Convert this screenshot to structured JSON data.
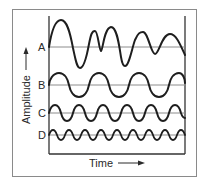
{
  "figure": {
    "y_axis_label": "Amplitude",
    "x_axis_label": "Time",
    "waves": [
      {
        "label": "A",
        "description": "irregular complex wave",
        "baseline_y": 47
      },
      {
        "label": "B",
        "description": "regular sine wave, low frequency",
        "baseline_y": 85
      },
      {
        "label": "C",
        "description": "regular sine wave, medium frequency",
        "baseline_y": 113
      },
      {
        "label": "D",
        "description": "regular sine wave, high frequency",
        "baseline_y": 135
      }
    ]
  },
  "colors": {
    "frame": "#8a8a8a",
    "axes": "#333333",
    "baseline": "#8c8c8c",
    "wave": "#1e1e1e",
    "text": "#2a2a2a"
  }
}
